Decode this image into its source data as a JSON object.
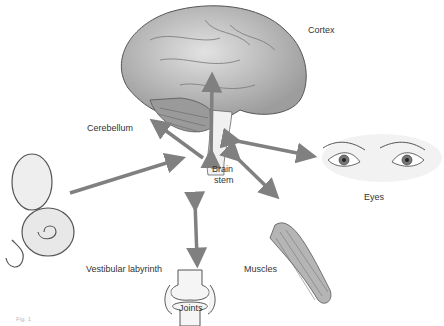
{
  "labels": {
    "cortex": "Cortex",
    "cerebellum": "Cerebellum",
    "brain_stem_1": "Brain",
    "brain_stem_2": "stem",
    "eyes": "Eyes",
    "vestibular": "Vestibular labyrinth",
    "muscles": "Muscles",
    "joints": "Joints",
    "figure": "Fig. 1"
  },
  "colors": {
    "arrow": "#808080",
    "brain_fill": "#c8c8c8",
    "outline": "#555555"
  }
}
